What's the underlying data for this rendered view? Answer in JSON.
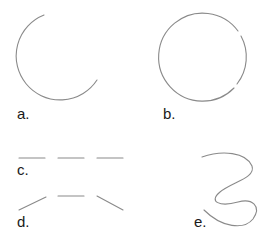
{
  "figure": {
    "stroke_color": "#8a8a8a",
    "label_color": "#1a1a1a",
    "panels": [
      {
        "id": "a",
        "label": "a.",
        "shape": "open-arc"
      },
      {
        "id": "b",
        "label": "b.",
        "shape": "circle-with-gaps"
      },
      {
        "id": "c",
        "label": "c.",
        "shape": "collinear-dashes"
      },
      {
        "id": "d",
        "label": "d.",
        "shape": "bent-dashes"
      },
      {
        "id": "e",
        "label": "e.",
        "shape": "wavy-curve"
      }
    ]
  }
}
